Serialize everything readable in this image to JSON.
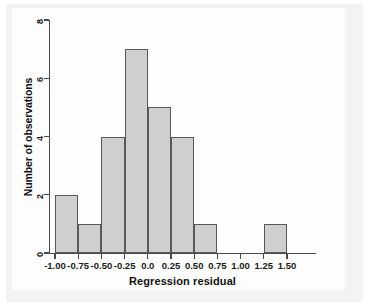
{
  "chart_data": {
    "type": "bar",
    "title": "",
    "subtitle": "",
    "xlabel": "Regression residual",
    "ylabel": "Number of observations",
    "grid": false,
    "legend": null,
    "xlim": [
      -1.125,
      1.5
    ],
    "ylim": [
      0,
      8
    ],
    "bin_width": 0.25,
    "xticks": [
      "-1.00",
      "-0.75",
      "-0.50",
      "-0.25",
      "0.0",
      "0.25",
      "0.50",
      "0.75",
      "1.00",
      "1.25",
      "1.50"
    ],
    "xtick_values": [
      -1.0,
      -0.75,
      -0.5,
      -0.25,
      0.0,
      0.25,
      0.5,
      0.75,
      1.0,
      1.25,
      1.5
    ],
    "yticks": [
      "0",
      "2",
      "4",
      "6",
      "8"
    ],
    "ytick_values": [
      0,
      2,
      4,
      6,
      8
    ],
    "categories": [
      "-1.00 to -0.75",
      "-0.75 to -0.50",
      "-0.50 to -0.25",
      "-0.25 to 0.00",
      "0.00 to 0.25",
      "0.25 to 0.50",
      "0.50 to 0.75",
      "0.75 to 1.00",
      "1.00 to 1.25",
      "1.25 to 1.50"
    ],
    "values": [
      2,
      1,
      4,
      7,
      5,
      4,
      1,
      0,
      0,
      1
    ],
    "bins": [
      {
        "left": -1.0,
        "right": -0.75,
        "count": 2
      },
      {
        "left": -0.75,
        "right": -0.5,
        "count": 1
      },
      {
        "left": -0.5,
        "right": -0.25,
        "count": 4
      },
      {
        "left": -0.25,
        "right": 0.0,
        "count": 7
      },
      {
        "left": 0.0,
        "right": 0.25,
        "count": 5
      },
      {
        "left": 0.25,
        "right": 0.5,
        "count": 4
      },
      {
        "left": 0.5,
        "right": 0.75,
        "count": 1
      },
      {
        "left": 0.75,
        "right": 1.0,
        "count": 0
      },
      {
        "left": 1.0,
        "right": 1.25,
        "count": 0
      },
      {
        "left": 1.25,
        "right": 1.5,
        "count": 1
      }
    ],
    "total_observations": 25,
    "colors": {
      "bar_fill": "#cfcfcf",
      "bar_edge": "#585858",
      "axis": "#4a4a4a",
      "text": "#111111",
      "plot_background": "#fdfdfd",
      "panel_background": "#f3f3f3"
    }
  }
}
